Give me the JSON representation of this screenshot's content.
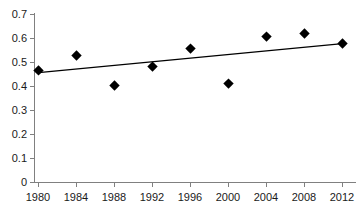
{
  "chart_data": {
    "type": "scatter",
    "title": "",
    "subtitle": "",
    "xlabel": "",
    "ylabel": "",
    "x": [
      1980,
      1984,
      1988,
      1992,
      1996,
      2000,
      2004,
      2008,
      2012
    ],
    "values": [
      0.467,
      0.529,
      0.404,
      0.483,
      0.558,
      0.412,
      0.608,
      0.621,
      0.579
    ],
    "series": [
      {
        "name": "data-points",
        "marker": "diamond",
        "color": "#000000",
        "values": [
          0.467,
          0.529,
          0.404,
          0.483,
          0.558,
          0.412,
          0.608,
          0.621,
          0.579
        ]
      },
      {
        "name": "trendline",
        "type": "line",
        "color": "#000000",
        "endpoints": [
          {
            "x": 1980,
            "y": 0.458
          },
          {
            "x": 2012,
            "y": 0.579
          }
        ]
      }
    ],
    "categories": [
      "1980",
      "1984",
      "1988",
      "1992",
      "1996",
      "2000",
      "2004",
      "2008",
      "2012"
    ],
    "x_tick_labels": [
      "1980",
      "1984",
      "1988",
      "1992",
      "1996",
      "2000",
      "2004",
      "2008",
      "2012"
    ],
    "y_tick_labels": [
      "0",
      "0.1",
      "0.2",
      "0.3",
      "0.4",
      "0.5",
      "0.6",
      "0.7"
    ],
    "y_tick_values": [
      0,
      0.1,
      0.2,
      0.3,
      0.4,
      0.5,
      0.6,
      0.7
    ],
    "ylim": [
      0,
      0.7
    ],
    "xlim": [
      1980,
      2012
    ],
    "grid": false,
    "legend": false,
    "legend_position": "none",
    "axis_color": "#808080",
    "text_color": "#1a1a1a",
    "background": "#ffffff"
  }
}
